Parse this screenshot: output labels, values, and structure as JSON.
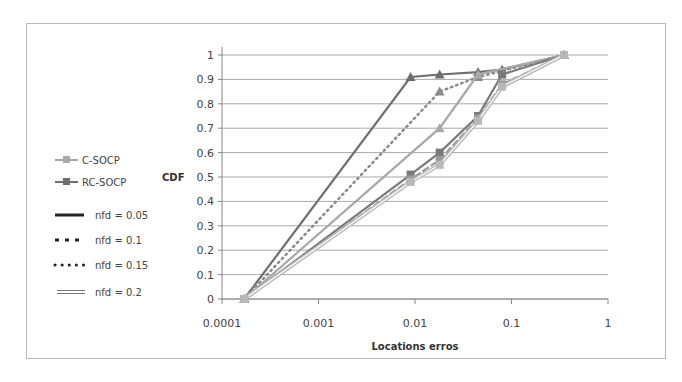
{
  "chart_data": {
    "type": "line",
    "title": "",
    "xlabel": "Locations erros",
    "ylabel": "CDF",
    "x_scale": "log",
    "xlim": [
      0.0001,
      1
    ],
    "ylim": [
      0,
      1
    ],
    "x_ticks": [
      "0.0001",
      "0.001",
      "0.01",
      "0.1",
      "1"
    ],
    "y_ticks": [
      "0",
      "0.1",
      "0.2",
      "0.3",
      "0.4",
      "0.5",
      "0.6",
      "0.7",
      "0.8",
      "0.9",
      "1"
    ],
    "grid": "horizontal",
    "legend_position": "left",
    "legend": {
      "methods": [
        {
          "label": "C-SOCP",
          "color": "#a8a8a8",
          "marker": "square"
        },
        {
          "label": "RC-SOCP",
          "color": "#6e6e6e",
          "marker": "square"
        }
      ],
      "styles": [
        {
          "label": "nfd = 0.05",
          "style": "solid"
        },
        {
          "label": "nfd = 0.1",
          "style": "dashed"
        },
        {
          "label": "nfd = 0.15",
          "style": "dotted"
        },
        {
          "label": "nfd = 0.2",
          "style": "double"
        }
      ]
    },
    "series": [
      {
        "name": "RC-SOCP nfd=0.05",
        "color": "#6e6e6e",
        "style": "solid",
        "marker": "triangle",
        "x": [
          0.00017,
          0.009,
          0.018,
          0.045,
          0.08,
          0.35
        ],
        "y": [
          0,
          0.91,
          0.92,
          0.93,
          0.94,
          1.0
        ]
      },
      {
        "name": "C-SOCP nfd=0.15",
        "color": "#8a8a8a",
        "style": "dotted",
        "marker": "triangle",
        "x": [
          0.00017,
          0.018,
          0.045,
          0.35
        ],
        "y": [
          0,
          0.85,
          0.91,
          1.0
        ]
      },
      {
        "name": "C-SOCP nfd=0.05",
        "color": "#a8a8a8",
        "style": "solid",
        "marker": "triangle",
        "x": [
          0.00017,
          0.018,
          0.045,
          0.35
        ],
        "y": [
          0,
          0.7,
          0.92,
          1.0
        ]
      },
      {
        "name": "RC-SOCP nfd=0.1",
        "color": "#7a7a7a",
        "style": "solid",
        "marker": "square",
        "x": [
          0.00017,
          0.009,
          0.018,
          0.045,
          0.08,
          0.35
        ],
        "y": [
          0,
          0.51,
          0.6,
          0.75,
          0.92,
          1.0
        ]
      },
      {
        "name": "C-SOCP nfd=0.1",
        "color": "#9a9a9a",
        "style": "dashed",
        "marker": "square",
        "x": [
          0.00017,
          0.009,
          0.018,
          0.045,
          0.08,
          0.35
        ],
        "y": [
          0,
          0.49,
          0.57,
          0.74,
          0.88,
          1.0
        ]
      },
      {
        "name": "C-SOCP nfd=0.2",
        "color": "#b8b8b8",
        "style": "double",
        "marker": "square",
        "x": [
          0.00017,
          0.009,
          0.018,
          0.045,
          0.08,
          0.35
        ],
        "y": [
          0,
          0.48,
          0.55,
          0.73,
          0.87,
          1.0
        ]
      }
    ]
  }
}
